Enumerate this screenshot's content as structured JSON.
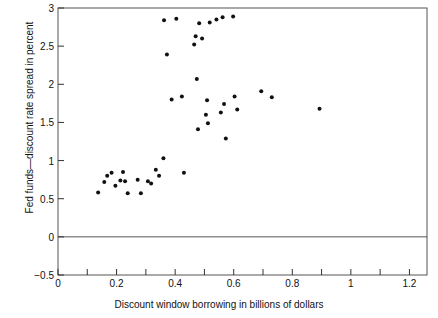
{
  "chart_data": {
    "type": "scatter",
    "title": "",
    "xlabel": "Discount window borrowing in billions of dollars",
    "ylabel": "Fed funds—discount rate spread in percent",
    "xlim": [
      0,
      1.26
    ],
    "ylim": [
      -0.5,
      3
    ],
    "grid": false,
    "legend": null,
    "x_major_ticks": [
      0,
      0.2,
      0.4,
      0.6,
      0.8,
      1,
      1.2
    ],
    "x_major_tick_labels": [
      "0",
      "0.2",
      "0.4",
      "0.6",
      "0.8",
      "1",
      "1.2"
    ],
    "x_minor_tick_step": 0.1,
    "y_major_ticks": [
      -0.5,
      0,
      0.5,
      1,
      1.5,
      2,
      2.5,
      3
    ],
    "y_major_tick_labels": [
      "−0.5",
      "0",
      "0.5",
      "1",
      "1.5",
      "2",
      "2.5",
      "3"
    ],
    "reference_lines": [
      {
        "orientation": "horizontal",
        "y": 0,
        "color": "#555555"
      }
    ],
    "marker": {
      "shape": "circle",
      "color": "#111111",
      "size_px": 4
    },
    "points": [
      {
        "x": 0.137,
        "y": 0.58
      },
      {
        "x": 0.158,
        "y": 0.72
      },
      {
        "x": 0.168,
        "y": 0.8
      },
      {
        "x": 0.183,
        "y": 0.84
      },
      {
        "x": 0.196,
        "y": 0.67
      },
      {
        "x": 0.213,
        "y": 0.74
      },
      {
        "x": 0.222,
        "y": 0.85
      },
      {
        "x": 0.229,
        "y": 0.73
      },
      {
        "x": 0.238,
        "y": 0.57
      },
      {
        "x": 0.272,
        "y": 0.75
      },
      {
        "x": 0.283,
        "y": 0.57
      },
      {
        "x": 0.307,
        "y": 0.73
      },
      {
        "x": 0.318,
        "y": 0.7
      },
      {
        "x": 0.334,
        "y": 0.88
      },
      {
        "x": 0.345,
        "y": 0.8
      },
      {
        "x": 0.36,
        "y": 1.03
      },
      {
        "x": 0.362,
        "y": 2.84
      },
      {
        "x": 0.372,
        "y": 2.39
      },
      {
        "x": 0.388,
        "y": 1.8
      },
      {
        "x": 0.404,
        "y": 2.86
      },
      {
        "x": 0.423,
        "y": 1.84
      },
      {
        "x": 0.43,
        "y": 0.84
      },
      {
        "x": 0.465,
        "y": 2.52
      },
      {
        "x": 0.47,
        "y": 2.63
      },
      {
        "x": 0.474,
        "y": 2.07
      },
      {
        "x": 0.478,
        "y": 1.41
      },
      {
        "x": 0.482,
        "y": 2.8
      },
      {
        "x": 0.492,
        "y": 2.6
      },
      {
        "x": 0.505,
        "y": 1.6
      },
      {
        "x": 0.509,
        "y": 1.79
      },
      {
        "x": 0.512,
        "y": 1.49
      },
      {
        "x": 0.518,
        "y": 2.81
      },
      {
        "x": 0.541,
        "y": 2.85
      },
      {
        "x": 0.556,
        "y": 1.63
      },
      {
        "x": 0.562,
        "y": 2.88
      },
      {
        "x": 0.567,
        "y": 1.74
      },
      {
        "x": 0.573,
        "y": 1.29
      },
      {
        "x": 0.598,
        "y": 2.89
      },
      {
        "x": 0.603,
        "y": 1.84
      },
      {
        "x": 0.612,
        "y": 1.67
      },
      {
        "x": 0.694,
        "y": 1.91
      },
      {
        "x": 0.73,
        "y": 1.83
      },
      {
        "x": 0.893,
        "y": 1.68
      }
    ]
  }
}
